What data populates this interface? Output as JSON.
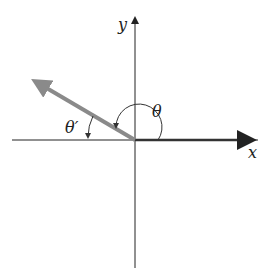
{
  "diagram": {
    "type": "reference-angle",
    "labels": {
      "x_axis": "x",
      "y_axis": "y",
      "angle": "θ",
      "reference_angle": "θ′"
    },
    "colors": {
      "axes": "#222222",
      "terminal_side": "#8a8a8a",
      "initial_side": "#333333"
    },
    "geometry": {
      "origin": [
        135,
        140
      ],
      "terminal_side_end": [
        31,
        79
      ],
      "initial_side_end": [
        258,
        140
      ]
    }
  }
}
